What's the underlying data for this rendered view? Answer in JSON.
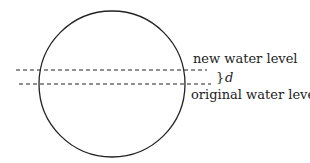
{
  "diagram": {
    "labels": {
      "new_level": "new water level",
      "original_level": "original water level",
      "brace": "}",
      "d": "d"
    },
    "colors": {
      "stroke": "#222222",
      "background": "#ffffff"
    },
    "circle": {
      "cx": 112,
      "cy": 84,
      "r": 73
    },
    "lines": {
      "new_level_y": 70,
      "original_level_y": 84
    }
  }
}
